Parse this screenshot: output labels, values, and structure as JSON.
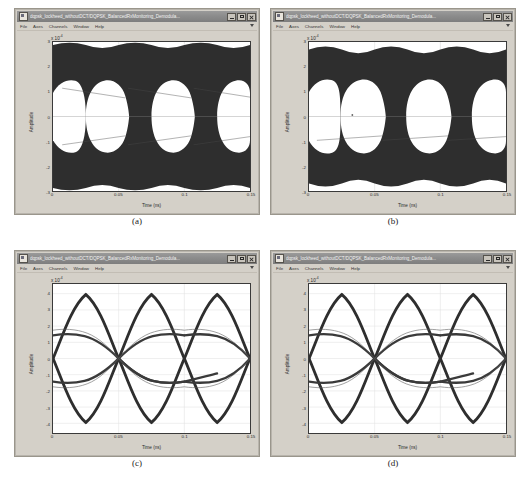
{
  "window": {
    "title": "dqpsk_lockheed_withoutDCT/DQPSK_BalancedRxMonitoring_Demodula...",
    "icon": "scope-icon",
    "buttons": {
      "minimize": "minimize-button",
      "maximize": "maximize-button",
      "close": "close-button"
    },
    "menus": [
      "File",
      "Axes",
      "Channels",
      "Window",
      "Help"
    ]
  },
  "captions": {
    "a": "(a)",
    "b": "(b)",
    "c": "(c)",
    "d": "(d)"
  },
  "bottom_note": "",
  "colors": {
    "trace": "#2e2e2e",
    "plot_background": "#ffffff",
    "grid": "#d9d9d9",
    "window_face": "#d4d0c8",
    "titlebar": "#8c8c8c",
    "titlebar_text": "#f2f2f2"
  },
  "chart_data": [
    {
      "id": "panel-a",
      "type": "line",
      "title": "",
      "xlabel": "Time (ns)",
      "ylabel": "Amplitude",
      "y_exponent": "x 10",
      "y_exponent_power": "-4",
      "xlim": [
        0,
        0.15
      ],
      "ylim": [
        -3,
        3
      ],
      "xticks": [
        0,
        0.05,
        0.1,
        0.15
      ],
      "xticklabels": [
        "0",
        "0.05",
        "0.1",
        "0.15"
      ],
      "yticks": [
        -3,
        -2,
        -1,
        0,
        1,
        2,
        3
      ],
      "yticklabels": [
        "-3",
        "-2",
        "-1",
        "0",
        "1",
        "2",
        "3"
      ],
      "grid": true,
      "legend": "none",
      "description": "Noisy DQPSK eye diagram, three open eyes, heavy trace density filling amplitude band +/-3e-4, eye openings span +/-1.5e-4",
      "eye_count": 3,
      "eye_open_amplitude": 1.5,
      "noise_envelope": 3.0,
      "symbol_period": 0.05
    },
    {
      "id": "panel-b",
      "type": "line",
      "title": "",
      "xlabel": "Time (ns)",
      "ylabel": "Amplitude",
      "y_exponent": "x 10",
      "y_exponent_power": "-4",
      "xlim": [
        0,
        0.15
      ],
      "ylim": [
        -3,
        3
      ],
      "xticks": [
        0,
        0.05,
        0.1,
        0.15
      ],
      "xticklabels": [
        "0",
        "0.05",
        "0.1",
        "0.15"
      ],
      "yticks": [
        -3,
        -2,
        -1,
        0,
        1,
        2,
        3
      ],
      "yticklabels": [
        "-3",
        "-2",
        "-1",
        "0",
        "1",
        "2",
        "3"
      ],
      "grid": true,
      "legend": "none",
      "description": "Noisy DQPSK eye diagram, three open eyes, heavy trace density filling amplitude band +/-3e-4, eye openings span +/-1.5e-4",
      "eye_count": 3,
      "eye_open_amplitude": 1.5,
      "noise_envelope": 3.0,
      "symbol_period": 0.05
    },
    {
      "id": "panel-c",
      "type": "line",
      "title": "",
      "xlabel": "Time (ns)",
      "ylabel": "Amplitude",
      "y_exponent": "x 10",
      "y_exponent_power": "-4",
      "xlim": [
        0,
        0.15
      ],
      "ylim": [
        -4.6,
        4.6
      ],
      "xticks": [
        0,
        0.05,
        0.1,
        0.15
      ],
      "xticklabels": [
        "0",
        "0.05",
        "0.1",
        "0.15"
      ],
      "yticks": [
        -4,
        -3,
        -2,
        -1,
        0,
        1,
        2,
        3,
        4
      ],
      "yticklabels": [
        "-4",
        "-3",
        "-2",
        "-1",
        "0",
        "1",
        "2",
        "3",
        "4"
      ],
      "grid": true,
      "legend": "none",
      "description": "Clean DQPSK eye diagram, three wide diamond eyes, peaks at +/-4.3e-4, inner crossing lobes near +/-1.4e-4",
      "eye_count": 3,
      "peak_amplitude": 4.3,
      "inner_lobe_amplitude": 1.4,
      "symbol_period": 0.05
    },
    {
      "id": "panel-d",
      "type": "line",
      "title": "",
      "xlabel": "Time (ns)",
      "ylabel": "Amplitude",
      "y_exponent": "x 10",
      "y_exponent_power": "-4",
      "xlim": [
        0,
        0.15
      ],
      "ylim": [
        -4.6,
        4.6
      ],
      "xticks": [
        0,
        0.05,
        0.1,
        0.15
      ],
      "xticklabels": [
        "0",
        "0.05",
        "0.1",
        "0.15"
      ],
      "yticks": [
        -4,
        -3,
        -2,
        -1,
        0,
        1,
        2,
        3,
        4
      ],
      "yticklabels": [
        "-4",
        "-3",
        "-2",
        "-1",
        "0",
        "1",
        "2",
        "3",
        "4"
      ],
      "grid": true,
      "legend": "none",
      "description": "Clean DQPSK eye diagram, three wide diamond eyes, peaks at +/-4.3e-4, inner crossing lobes near +/-1.4e-4",
      "eye_count": 3,
      "peak_amplitude": 4.3,
      "inner_lobe_amplitude": 1.4,
      "symbol_period": 0.05
    }
  ]
}
